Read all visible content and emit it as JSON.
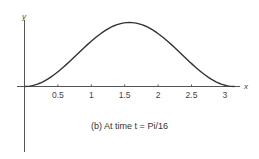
{
  "chart_data": {
    "type": "line",
    "title": "",
    "caption": "(b) At time t = Pi/16",
    "xlabel": "x",
    "ylabel": "y",
    "x_ticks": [
      0.5,
      1,
      1.5,
      2,
      2.5,
      3
    ],
    "x_tick_labels": [
      "0.5",
      "1",
      "1.5",
      "2",
      "2.5",
      "3"
    ],
    "xlim": [
      0,
      3.3
    ],
    "grid": false,
    "legend": null,
    "series": [
      {
        "name": "y = sin^2(x) (shape)",
        "x": [
          0,
          0.25,
          0.5,
          0.75,
          1.0,
          1.25,
          1.5,
          1.5708,
          1.75,
          2.0,
          2.25,
          2.5,
          2.75,
          3.0,
          3.1416
        ],
        "y": [
          0,
          0.06,
          0.23,
          0.46,
          0.71,
          0.9,
          0.995,
          1.0,
          0.97,
          0.83,
          0.6,
          0.36,
          0.15,
          0.02,
          0
        ]
      }
    ],
    "color": "#333333"
  },
  "labels": {
    "x_axis": "x",
    "y_axis": "y",
    "caption": "(b) At time t = Pi/16"
  }
}
